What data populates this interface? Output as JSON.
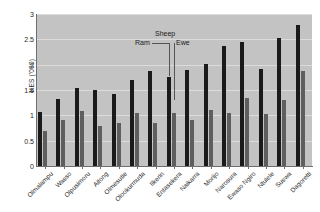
{
  "chart_data": {
    "type": "bar",
    "title": "",
    "subtitle": "",
    "xlabel": "",
    "ylabel": "KES ('000)",
    "ylim": [
      0,
      3
    ],
    "yticks": [
      "0",
      "0.5",
      "1",
      "1.5",
      "2",
      "2.5",
      "3"
    ],
    "ytick_values": [
      0,
      0.5,
      1,
      1.5,
      2,
      2.5,
      3
    ],
    "grid": true,
    "legend_position": "none",
    "categories": [
      "Olmalampu",
      "Wasso",
      "Olpusimoru",
      "Aitong",
      "Olmesutie",
      "Olookurmuda",
      "Ilkerin",
      "Entasekera",
      "Naikarra",
      "Morijo",
      "Narosura",
      "Ewaso Ngiro",
      "Ntulele",
      "Suswa",
      "Dagoretti"
    ],
    "series": [
      {
        "name": "Ram",
        "color": "#1a1a1a",
        "values": [
          1.07,
          1.33,
          1.54,
          1.51,
          1.42,
          1.7,
          1.87,
          1.76,
          1.9,
          2.01,
          2.36,
          2.45,
          1.91,
          2.52,
          2.78
        ]
      },
      {
        "name": "Ewe",
        "color": "#5e5e5e",
        "values": [
          0.7,
          0.9,
          1.09,
          0.79,
          0.85,
          1.04,
          0.85,
          1.05,
          0.9,
          1.11,
          1.04,
          1.35,
          1.02,
          1.31,
          1.88
        ]
      }
    ],
    "annotations": [
      {
        "text": "Sheep",
        "role": "group-label"
      },
      {
        "text": "Ram",
        "role": "series-callout"
      },
      {
        "text": "Ewe",
        "role": "series-callout"
      }
    ]
  },
  "annotation": {
    "sheep": "Sheep",
    "ram": "Ram",
    "ewe": "Ewe"
  },
  "plot": {
    "background_color": "#c3c3c3",
    "gridline_color": "#dcdcdc",
    "axis_color": "#6e6e6e"
  }
}
